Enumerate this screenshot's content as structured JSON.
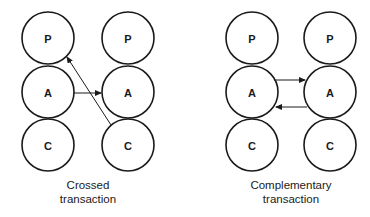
{
  "diagrams": [
    {
      "name": "crossed",
      "caption_line1": "Crossed",
      "caption_line2": "transaction",
      "left": {
        "P": "P",
        "A": "A",
        "C": "C"
      },
      "right": {
        "P": "P",
        "A": "A",
        "C": "C"
      },
      "arrows": [
        {
          "from": "left.A",
          "to": "right.A"
        },
        {
          "from": "right.C",
          "to": "left.P"
        }
      ]
    },
    {
      "name": "complementary",
      "caption_line1": "Complementary",
      "caption_line2": "transaction",
      "left": {
        "P": "P",
        "A": "A",
        "C": "C"
      },
      "right": {
        "P": "P",
        "A": "A",
        "C": "C"
      },
      "arrows": [
        {
          "from": "left.A",
          "to": "right.A"
        },
        {
          "from": "right.A",
          "to": "left.A"
        }
      ]
    }
  ],
  "colors": {
    "stroke": "#1a1a1a",
    "background": "#ffffff"
  }
}
